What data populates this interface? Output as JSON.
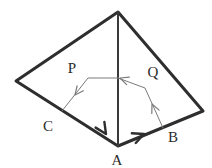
{
  "figure": {
    "type": "geometry-vector-diagram",
    "canvas": {
      "width": 212,
      "height": 167,
      "background": "#ffffff"
    },
    "colors": {
      "outline": "#2e2e2e",
      "median": "#3a3a3a",
      "vector": "#7a7a7a",
      "label": "#2b2b2b"
    },
    "outer_shape": {
      "name": "quadrilateral",
      "stroke_width": 3,
      "points": [
        {
          "name": "apex",
          "x": 118,
          "y": 12
        },
        {
          "name": "left",
          "x": 16,
          "y": 81
        },
        {
          "name": "bottom",
          "x": 118,
          "y": 146
        },
        {
          "name": "right",
          "x": 203,
          "y": 111
        }
      ]
    },
    "median_line": {
      "name": "apex-to-A",
      "stroke_width": 2,
      "from": {
        "x": 118,
        "y": 12
      },
      "to": {
        "x": 118,
        "y": 146
      }
    },
    "edge_arrows": [
      {
        "name": "arrow-on-CA",
        "at": {
          "x": 106,
          "y": 134
        },
        "direction_deg": 57,
        "description": "arrowhead on edge from C toward A"
      },
      {
        "name": "arrow-on-AB",
        "at": {
          "x": 144,
          "y": 134
        },
        "direction_deg": -22,
        "description": "arrowhead on edge from A toward B"
      }
    ],
    "vector_paths": [
      {
        "name": "vector-P",
        "stroke_width": 1,
        "points": [
          {
            "x": 118,
            "y": 78
          },
          {
            "x": 88,
            "y": 78
          },
          {
            "x": 62,
            "y": 111
          }
        ],
        "arrowheads": [
          {
            "at": {
              "x": 75,
              "y": 95
            },
            "direction_deg": 128
          }
        ]
      },
      {
        "name": "vector-Q",
        "stroke_width": 1,
        "points": [
          {
            "x": 163,
            "y": 128
          },
          {
            "x": 145,
            "y": 88
          },
          {
            "x": 118,
            "y": 78
          }
        ],
        "arrowheads": [
          {
            "at": {
              "x": 152,
              "y": 104
            },
            "direction_deg": -114
          },
          {
            "at": {
              "x": 120,
              "y": 78
            },
            "direction_deg": 200
          }
        ]
      }
    ]
  },
  "labels": {
    "P": {
      "text": "P",
      "x": 72,
      "y": 68
    },
    "Q": {
      "text": "Q",
      "x": 153,
      "y": 72
    },
    "C": {
      "text": "C",
      "x": 48,
      "y": 126
    },
    "A": {
      "text": "A",
      "x": 117,
      "y": 160
    },
    "B": {
      "text": "B",
      "x": 173,
      "y": 137
    }
  }
}
